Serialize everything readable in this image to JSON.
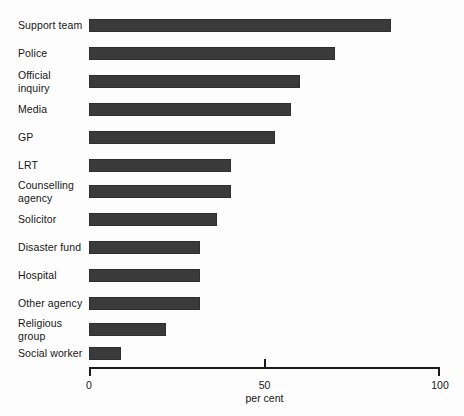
{
  "chart_data": {
    "type": "bar",
    "orientation": "horizontal",
    "title": "",
    "subtitle": "",
    "xlabel": "per cent",
    "ylabel": "",
    "xlim": [
      0,
      100
    ],
    "xticks": [
      0,
      50,
      100
    ],
    "xtick_labels": [
      "0",
      "50",
      "100"
    ],
    "grid": false,
    "legend": null,
    "bar_color": "#3a3a3a",
    "background_color": "#fdfdfd",
    "categories": [
      "Support team",
      "Police",
      "Official\ninquiry",
      "Media",
      "GP",
      "LRT",
      "Counselling\nagency",
      "Solicitor",
      "Disaster fund",
      "Hospital",
      "Other agency",
      "Religious\ngroup",
      "Social worker"
    ],
    "values": [
      86,
      70,
      60,
      57.5,
      53,
      40.5,
      40.5,
      36.5,
      31.5,
      31.5,
      31.5,
      22,
      9
    ]
  },
  "axis": {
    "tick_0": "0",
    "tick_50": "50",
    "tick_100": "100",
    "title": "per cent"
  }
}
